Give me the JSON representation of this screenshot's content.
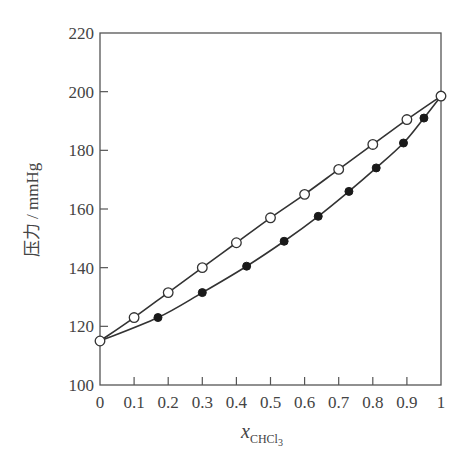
{
  "chart_data": {
    "type": "line",
    "title": "",
    "xlabel": "x_CHCl3",
    "xlabel_main": "x",
    "xlabel_sub": "CHCl",
    "xlabel_subsub": "3",
    "ylabel": "压力 / mmHg",
    "xlim": [
      0,
      1
    ],
    "ylim": [
      100,
      220
    ],
    "x_ticks": [
      "0",
      "0.1",
      "0.2",
      "0.3",
      "0.4",
      "0.5",
      "0.6",
      "0.7",
      "0.8",
      "0.9",
      "1"
    ],
    "y_ticks": [
      "100",
      "120",
      "140",
      "160",
      "180",
      "200",
      "220"
    ],
    "grid": false,
    "legend": null,
    "series": [
      {
        "name": "liquid line (open circles)",
        "marker": "open-circle",
        "x": [
          0,
          0.1,
          0.2,
          0.3,
          0.4,
          0.5,
          0.6,
          0.7,
          0.8,
          0.9,
          1.0
        ],
        "y": [
          115,
          123,
          131.5,
          140,
          148.5,
          157,
          165,
          173.5,
          182,
          190.5,
          198.5
        ]
      },
      {
        "name": "vapor line (filled circles)",
        "marker": "filled-circle",
        "x": [
          0,
          0.17,
          0.3,
          0.43,
          0.54,
          0.64,
          0.73,
          0.81,
          0.89,
          0.95,
          1.0
        ],
        "y": [
          115,
          123,
          131.5,
          140.5,
          149,
          157.5,
          166,
          174,
          182.5,
          191,
          198.5
        ],
        "endpoints_shared": true
      }
    ]
  },
  "colors": {
    "axis": "#555555",
    "line": "#333333",
    "marker_fill_filled": "#1a1a1a",
    "marker_fill_open": "#ffffff"
  }
}
